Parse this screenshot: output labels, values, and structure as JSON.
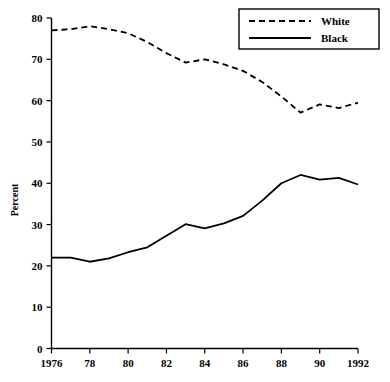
{
  "chart_data": {
    "type": "line",
    "title": "",
    "subtitle": "",
    "xlabel": "",
    "ylabel": "Percent",
    "xlim": [
      1976,
      1992
    ],
    "ylim": [
      0,
      80
    ],
    "grid": false,
    "legend_position": "top-right",
    "x": [
      1976,
      1977,
      1978,
      1979,
      1980,
      1981,
      1982,
      1983,
      1984,
      1985,
      1986,
      1987,
      1988,
      1989,
      1990,
      1991,
      1992
    ],
    "x_tick_labels": [
      "1976",
      "78",
      "80",
      "82",
      "84",
      "86",
      "88",
      "90",
      "1992"
    ],
    "x_tick_values": [
      1976,
      1978,
      1980,
      1982,
      1984,
      1986,
      1988,
      1990,
      1992
    ],
    "y_tick_labels": [
      "0",
      "10",
      "20",
      "30",
      "40",
      "50",
      "60",
      "70",
      "80"
    ],
    "y_tick_values": [
      0,
      10,
      20,
      30,
      40,
      50,
      60,
      70,
      80
    ],
    "series": [
      {
        "name": "White",
        "style": "dashed",
        "color": "#000000",
        "values": [
          77.0,
          77.3,
          78.0,
          77.3,
          76.3,
          74.2,
          71.5,
          69.2,
          70.0,
          68.8,
          67.2,
          64.5,
          61.0,
          57.1,
          59.1,
          58.2,
          59.5
        ]
      },
      {
        "name": "Black",
        "style": "solid",
        "color": "#000000",
        "values": [
          22.0,
          22.0,
          21.0,
          21.8,
          23.3,
          24.5,
          27.3,
          30.1,
          29.1,
          30.3,
          32.1,
          35.8,
          40.0,
          42.0,
          40.9,
          41.3,
          39.7
        ]
      }
    ]
  },
  "legend": {
    "entries": [
      {
        "label": "White",
        "style": "dashed"
      },
      {
        "label": "Black",
        "style": "solid"
      }
    ]
  },
  "axes": {
    "y_axis_title": "Percent"
  }
}
